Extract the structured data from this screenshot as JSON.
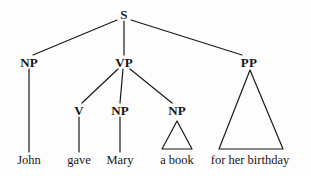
{
  "diagram": {
    "type": "syntax-tree",
    "sentence": "John gave Mary a book for her birthday",
    "background_color": "#fdfdfd",
    "stroke_color": "#1a1a1a",
    "text_color": "#161616",
    "nodes": [
      {
        "id": "S",
        "label": "S",
        "x": 124,
        "y": 14,
        "kind": "category"
      },
      {
        "id": "NP1",
        "label": "NP",
        "x": 29,
        "y": 62,
        "kind": "category"
      },
      {
        "id": "VP",
        "label": "VP",
        "x": 124,
        "y": 62,
        "kind": "category"
      },
      {
        "id": "PP",
        "label": "PP",
        "x": 249,
        "y": 62,
        "kind": "category"
      },
      {
        "id": "V",
        "label": "V",
        "x": 79,
        "y": 110,
        "kind": "category"
      },
      {
        "id": "NP2",
        "label": "NP",
        "x": 120,
        "y": 110,
        "kind": "category"
      },
      {
        "id": "NP3",
        "label": "NP",
        "x": 177,
        "y": 110,
        "kind": "category"
      }
    ],
    "leaves": [
      {
        "id": "w-john",
        "label": "John",
        "x": 29,
        "y": 160
      },
      {
        "id": "w-gave",
        "label": "gave",
        "x": 79,
        "y": 160
      },
      {
        "id": "w-mary",
        "label": "Mary",
        "x": 120,
        "y": 160
      },
      {
        "id": "w-a-book",
        "label": "a book",
        "x": 177,
        "y": 160
      },
      {
        "id": "w-birthday",
        "label": "for her birthday",
        "x": 250,
        "y": 160
      }
    ],
    "edges": [
      {
        "from": "S",
        "to": "NP1",
        "x1": 117,
        "y1": 20,
        "x2": 33,
        "y2": 55
      },
      {
        "from": "S",
        "to": "VP",
        "x1": 124,
        "y1": 21,
        "x2": 124,
        "y2": 55
      },
      {
        "from": "S",
        "to": "PP",
        "x1": 131,
        "y1": 20,
        "x2": 242,
        "y2": 55
      },
      {
        "from": "NP1",
        "to": "w-john",
        "x1": 29,
        "y1": 69,
        "x2": 29,
        "y2": 152
      },
      {
        "from": "VP",
        "to": "V",
        "x1": 118,
        "y1": 69,
        "x2": 82,
        "y2": 103
      },
      {
        "from": "VP",
        "to": "NP2",
        "x1": 123,
        "y1": 69,
        "x2": 120,
        "y2": 103
      },
      {
        "from": "VP",
        "to": "NP3",
        "x1": 130,
        "y1": 69,
        "x2": 172,
        "y2": 103
      },
      {
        "from": "V",
        "to": "w-gave",
        "x1": 79,
        "y1": 117,
        "x2": 79,
        "y2": 152
      },
      {
        "from": "NP2",
        "to": "w-mary",
        "x1": 120,
        "y1": 117,
        "x2": 120,
        "y2": 152
      }
    ],
    "triangles": [
      {
        "id": "tri-np3",
        "parent": "NP3",
        "covers": "a book",
        "apex_x": 177,
        "apex_y": 121,
        "left_x": 162,
        "right_x": 192,
        "base_y": 149
      },
      {
        "id": "tri-pp",
        "parent": "PP",
        "covers": "for her birthday",
        "apex_x": 250,
        "apex_y": 70,
        "left_x": 219,
        "right_x": 283,
        "base_y": 149
      }
    ]
  }
}
